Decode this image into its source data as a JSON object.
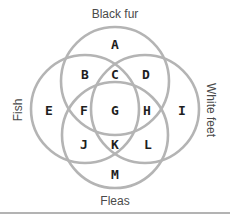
{
  "diagram": {
    "type": "venn-4-circle",
    "colors": {
      "ring": "#b4b4b4",
      "region_text": "#1e1e1e",
      "set_text": "#4a4a4a",
      "divider": "#9a9a9a"
    },
    "sets": {
      "top": {
        "label": "Black fur"
      },
      "left": {
        "label": "Fish"
      },
      "right": {
        "label": "White feet"
      },
      "bottom": {
        "label": "Fleas"
      }
    },
    "regions": {
      "A": "A",
      "B": "B",
      "C": "C",
      "D": "D",
      "E": "E",
      "F": "F",
      "G": "G",
      "H": "H",
      "I": "I",
      "J": "J",
      "K": "K",
      "L": "L",
      "M": "M"
    }
  }
}
